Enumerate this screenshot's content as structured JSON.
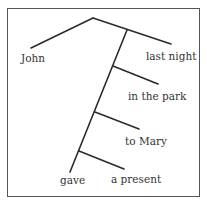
{
  "diagram": {
    "type": "reed-kellogg-sentence-diagram",
    "subject": "John",
    "verb": "gave",
    "modifiers": [
      "last night",
      "in the park",
      "to Mary",
      "a present"
    ],
    "labels": {
      "john": "John",
      "last_night": "last night",
      "in_the_park": "in the park",
      "to_mary": "to Mary",
      "gave": "gave",
      "a_present": "a present"
    },
    "line_color": "#2b2b2b",
    "frame_color": "#555555"
  }
}
